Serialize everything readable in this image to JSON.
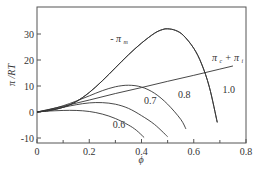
{
  "chart_data": {
    "type": "line",
    "title": "",
    "xlabel": "ϕ",
    "ylabel": "π /RT",
    "xlim": [
      0,
      0.8
    ],
    "ylim": [
      -12,
      38
    ],
    "xticks": [
      0,
      0.2,
      0.4,
      0.6,
      0.8
    ],
    "xtick_labels": [
      "0",
      "0.2",
      "0.4",
      "0.6",
      "0.8"
    ],
    "xminor": [
      0.1,
      0.3,
      0.5,
      0.7
    ],
    "yticks": [
      -10,
      0,
      10,
      20,
      30
    ],
    "ytick_labels": [
      "-10",
      "0",
      "10",
      "20",
      "30"
    ],
    "grid": false,
    "series": [
      {
        "name": "-π m",
        "label": "- π",
        "label_sub": "m",
        "x": [
          0,
          0.05,
          0.1,
          0.15,
          0.2,
          0.25,
          0.3,
          0.35,
          0.4,
          0.45,
          0.48,
          0.5,
          0.53,
          0.56,
          0.6,
          0.63,
          0.66,
          0.69
        ],
        "y": [
          0,
          0.6,
          1.8,
          4.0,
          7.5,
          12,
          17,
          22,
          26.5,
          30.3,
          31.7,
          32,
          31.4,
          29.5,
          24.5,
          18.5,
          9.5,
          -4
        ]
      },
      {
        "name": "π c + π i",
        "label": "π",
        "label_sub": "c",
        "label2": " + π",
        "label2_sub": "i",
        "x": [
          0,
          0.1,
          0.2,
          0.3,
          0.4,
          0.5,
          0.6,
          0.7,
          0.75
        ],
        "y": [
          0,
          2.2,
          4.6,
          7.1,
          9.4,
          11.8,
          14.1,
          16.5,
          17.7
        ]
      },
      {
        "name": "0.6",
        "label": "0.6",
        "x": [
          0,
          0.05,
          0.1,
          0.15,
          0.2,
          0.25,
          0.3,
          0.35,
          0.38,
          0.41
        ],
        "y": [
          0,
          0.4,
          0.6,
          0.6,
          0.2,
          -0.8,
          -2.5,
          -5.0,
          -7.0,
          -9.8
        ]
      },
      {
        "name": "0.7",
        "label": "0.7",
        "x": [
          0,
          0.05,
          0.1,
          0.15,
          0.2,
          0.25,
          0.3,
          0.35,
          0.4,
          0.45,
          0.5
        ],
        "y": [
          0,
          0.8,
          1.8,
          2.8,
          3.5,
          3.6,
          3.0,
          1.4,
          -1.4,
          -4.8,
          -9.5
        ]
      },
      {
        "name": "0.8",
        "label": "0.8",
        "x": [
          0,
          0.05,
          0.1,
          0.15,
          0.2,
          0.25,
          0.3,
          0.35,
          0.4,
          0.45,
          0.5,
          0.55,
          0.57
        ],
        "y": [
          0,
          1.0,
          2.4,
          4.2,
          6.2,
          8.2,
          9.7,
          10.3,
          9.6,
          7.2,
          3.0,
          -2.8,
          -6.5
        ]
      },
      {
        "name": "1.0",
        "label": "1.0",
        "x": [
          0,
          0.05,
          0.1,
          0.15,
          0.2,
          0.25,
          0.3,
          0.35,
          0.4,
          0.45,
          0.48,
          0.5,
          0.53,
          0.56,
          0.6,
          0.63,
          0.66,
          0.69
        ],
        "y": [
          0,
          0.6,
          1.8,
          4.0,
          7.5,
          12,
          17,
          22,
          26.5,
          30.3,
          31.7,
          32,
          31.4,
          29.5,
          24.5,
          18.5,
          9.5,
          -4
        ]
      }
    ],
    "annotations": [
      {
        "text": "- π m",
        "x": 0.28,
        "y": 27
      },
      {
        "text": "π c + π i",
        "x": 0.67,
        "y": 19.5
      },
      {
        "text": "1.0",
        "x": 0.71,
        "y": 7.5
      },
      {
        "text": "0.8",
        "x": 0.54,
        "y": 5.5
      },
      {
        "text": "0.7",
        "x": 0.41,
        "y": 3
      },
      {
        "text": "0.6",
        "x": 0.29,
        "y": -6
      }
    ]
  }
}
